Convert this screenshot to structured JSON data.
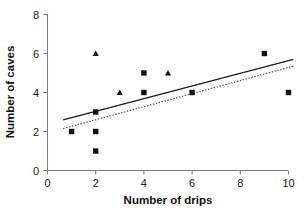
{
  "chart_data": {
    "type": "scatter",
    "title": "",
    "xlabel": "Number of drips",
    "ylabel": "Number of caves",
    "xlim": [
      0,
      10
    ],
    "ylim": [
      0,
      8
    ],
    "xticks": [
      0,
      2,
      4,
      6,
      8,
      10
    ],
    "yticks": [
      0,
      2,
      4,
      6,
      8
    ],
    "xtick_labels": [
      "0",
      "2",
      "4",
      "6",
      "8",
      "10"
    ],
    "ytick_labels": [
      "0",
      "2",
      "4",
      "6",
      "8"
    ],
    "grid": false,
    "legend": "none",
    "series": [
      {
        "name": "squares",
        "marker": "square",
        "color": "#101010",
        "points": [
          {
            "x": 1,
            "y": 2
          },
          {
            "x": 2,
            "y": 3
          },
          {
            "x": 2,
            "y": 2
          },
          {
            "x": 2,
            "y": 1
          },
          {
            "x": 4,
            "y": 5
          },
          {
            "x": 4,
            "y": 4
          },
          {
            "x": 6,
            "y": 4
          },
          {
            "x": 9,
            "y": 6
          },
          {
            "x": 10,
            "y": 4
          }
        ]
      },
      {
        "name": "triangles",
        "marker": "triangle",
        "color": "#101010",
        "points": [
          {
            "x": 2,
            "y": 6
          },
          {
            "x": 3,
            "y": 4
          },
          {
            "x": 5,
            "y": 5
          }
        ]
      }
    ],
    "trendlines": [
      {
        "name": "solid-trendline",
        "style": "solid",
        "color": "#1a1a1a",
        "x_start": 0.65,
        "y_start": 2.6,
        "x_end": 10.2,
        "y_end": 5.7
      },
      {
        "name": "dotted-trendline",
        "style": "dotted",
        "color": "#4d4d4d",
        "x_start": 0.65,
        "y_start": 2.15,
        "x_end": 10.2,
        "y_end": 5.35
      }
    ]
  },
  "axes": {
    "x_title": "Number of drips",
    "y_title": "Number of caves"
  }
}
